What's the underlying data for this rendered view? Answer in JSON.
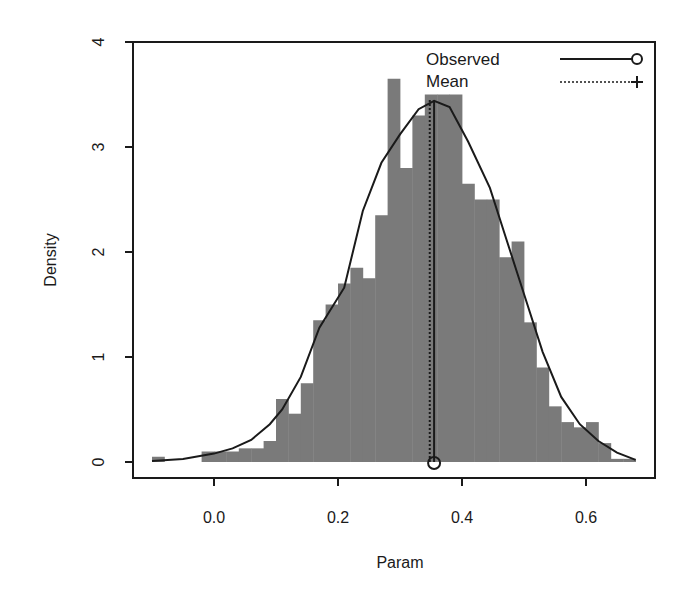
{
  "chart_data": {
    "type": "bar",
    "subtype": "histogram_with_density",
    "title": "",
    "xlabel": "Param",
    "ylabel": "Density",
    "xlim": [
      -0.12,
      0.7
    ],
    "ylim": [
      0,
      4
    ],
    "xticks": [
      0.0,
      0.2,
      0.4,
      0.6
    ],
    "xtick_labels": [
      "0.0",
      "0.2",
      "0.4",
      "0.6"
    ],
    "yticks": [
      0,
      1,
      2,
      3,
      4
    ],
    "ytick_labels": [
      "0",
      "1",
      "2",
      "3",
      "4"
    ],
    "grid": false,
    "bin_width": 0.02,
    "bins": [
      {
        "x0": -0.1,
        "x1": -0.08,
        "density": 0.05
      },
      {
        "x0": -0.02,
        "x1": 0.0,
        "density": 0.1
      },
      {
        "x0": 0.0,
        "x1": 0.02,
        "density": 0.1
      },
      {
        "x0": 0.02,
        "x1": 0.04,
        "density": 0.1
      },
      {
        "x0": 0.04,
        "x1": 0.06,
        "density": 0.13
      },
      {
        "x0": 0.06,
        "x1": 0.08,
        "density": 0.13
      },
      {
        "x0": 0.08,
        "x1": 0.1,
        "density": 0.2
      },
      {
        "x0": 0.1,
        "x1": 0.12,
        "density": 0.6
      },
      {
        "x0": 0.12,
        "x1": 0.14,
        "density": 0.46
      },
      {
        "x0": 0.14,
        "x1": 0.16,
        "density": 0.75
      },
      {
        "x0": 0.16,
        "x1": 0.18,
        "density": 1.35
      },
      {
        "x0": 0.18,
        "x1": 0.2,
        "density": 1.5
      },
      {
        "x0": 0.2,
        "x1": 0.22,
        "density": 1.7
      },
      {
        "x0": 0.22,
        "x1": 0.24,
        "density": 1.85
      },
      {
        "x0": 0.24,
        "x1": 0.26,
        "density": 1.75
      },
      {
        "x0": 0.26,
        "x1": 0.28,
        "density": 2.35
      },
      {
        "x0": 0.28,
        "x1": 0.3,
        "density": 3.65
      },
      {
        "x0": 0.3,
        "x1": 0.32,
        "density": 2.8
      },
      {
        "x0": 0.32,
        "x1": 0.34,
        "density": 3.3
      },
      {
        "x0": 0.34,
        "x1": 0.36,
        "density": 3.5
      },
      {
        "x0": 0.36,
        "x1": 0.38,
        "density": 3.5
      },
      {
        "x0": 0.38,
        "x1": 0.4,
        "density": 3.5
      },
      {
        "x0": 0.4,
        "x1": 0.42,
        "density": 2.65
      },
      {
        "x0": 0.42,
        "x1": 0.44,
        "density": 2.5
      },
      {
        "x0": 0.44,
        "x1": 0.46,
        "density": 2.5
      },
      {
        "x0": 0.46,
        "x1": 0.48,
        "density": 1.95
      },
      {
        "x0": 0.48,
        "x1": 0.5,
        "density": 2.1
      },
      {
        "x0": 0.5,
        "x1": 0.52,
        "density": 1.33
      },
      {
        "x0": 0.52,
        "x1": 0.54,
        "density": 0.9
      },
      {
        "x0": 0.54,
        "x1": 0.56,
        "density": 0.53
      },
      {
        "x0": 0.56,
        "x1": 0.58,
        "density": 0.38
      },
      {
        "x0": 0.58,
        "x1": 0.6,
        "density": 0.33
      },
      {
        "x0": 0.6,
        "x1": 0.62,
        "density": 0.38
      },
      {
        "x0": 0.62,
        "x1": 0.64,
        "density": 0.18
      },
      {
        "x0": 0.64,
        "x1": 0.66,
        "density": 0.03
      },
      {
        "x0": 0.66,
        "x1": 0.68,
        "density": 0.03
      }
    ],
    "density_curve": {
      "x": [
        -0.1,
        -0.05,
        0.0,
        0.03,
        0.06,
        0.09,
        0.11,
        0.14,
        0.17,
        0.21,
        0.24,
        0.27,
        0.3,
        0.33,
        0.355,
        0.38,
        0.41,
        0.445,
        0.47,
        0.5,
        0.53,
        0.56,
        0.59,
        0.62,
        0.65,
        0.68
      ],
      "y": [
        0.01,
        0.03,
        0.08,
        0.13,
        0.21,
        0.36,
        0.5,
        0.81,
        1.28,
        1.66,
        2.39,
        2.85,
        3.12,
        3.36,
        3.44,
        3.38,
        3.05,
        2.61,
        2.15,
        1.6,
        1.05,
        0.62,
        0.36,
        0.2,
        0.09,
        0.02
      ]
    },
    "observed": {
      "x": 0.355,
      "style": "solid",
      "marker": "circle"
    },
    "mean": {
      "x": 0.348,
      "style": "dotted",
      "marker": "plus"
    },
    "legend": {
      "position": "top-right",
      "entries": [
        {
          "label": "Observed",
          "line": "solid",
          "marker": "circle"
        },
        {
          "label": "Mean",
          "line": "dotted",
          "marker": "plus"
        }
      ]
    },
    "colors": {
      "bars": "#7a7a7a",
      "lines": "#1a1a1a",
      "background": "#ffffff"
    }
  }
}
